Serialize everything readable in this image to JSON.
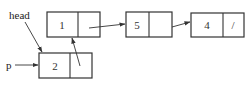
{
  "diagram": {
    "type": "linked-list",
    "labels": {
      "head": "head",
      "p": "p"
    },
    "nodes": [
      {
        "id": "n1",
        "value": "1",
        "next": ""
      },
      {
        "id": "n5",
        "value": "5",
        "next": ""
      },
      {
        "id": "n4",
        "value": "4",
        "next": "/"
      },
      {
        "id": "n2",
        "value": "2",
        "next": ""
      }
    ],
    "edges": [
      {
        "from": "head",
        "to": "n2"
      },
      {
        "from": "p",
        "to": "n2"
      },
      {
        "from": "n2",
        "to": "n1"
      },
      {
        "from": "n1",
        "to": "n5"
      },
      {
        "from": "n5",
        "to": "n4"
      }
    ]
  }
}
